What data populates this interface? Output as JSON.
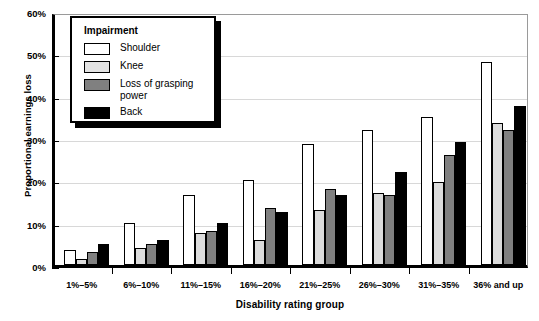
{
  "chart_data": {
    "type": "bar",
    "title": "",
    "xlabel": "Disability rating group",
    "ylabel": "Proportional earnings loss",
    "categories": [
      "1%–5%",
      "6%–10%",
      "11%–15%",
      "16%–20%",
      "21%–25%",
      "26%–30%",
      "31%–35%",
      "36% and up"
    ],
    "series": [
      {
        "name": "Shoulder",
        "color": "#ffffff",
        "values": [
          3.5,
          10.0,
          16.5,
          20.0,
          28.5,
          32.0,
          35.0,
          48.0
        ]
      },
      {
        "name": "Knee",
        "color": "#dcdcdc",
        "values": [
          1.5,
          4.0,
          7.5,
          6.0,
          13.0,
          17.0,
          19.5,
          33.5
        ]
      },
      {
        "name": "Loss of grasping power",
        "color": "#808080",
        "values": [
          3.0,
          5.0,
          8.0,
          13.5,
          18.0,
          16.5,
          26.0,
          32.0
        ]
      },
      {
        "name": "Back",
        "color": "#000000",
        "values": [
          5.0,
          6.0,
          10.0,
          12.5,
          16.5,
          22.0,
          29.0,
          37.5
        ]
      }
    ],
    "ylim": [
      0,
      60
    ],
    "yticks": [
      0,
      10,
      20,
      30,
      40,
      50,
      60
    ],
    "ytick_labels": [
      "0%",
      "10%",
      "20%",
      "30%",
      "40%",
      "50%",
      "60%"
    ],
    "grid": "horizontal",
    "legend_position": "top-left",
    "legend_title": "Impairment",
    "legend_entries": [
      "Shoulder",
      "Knee",
      "Loss of grasping\npower",
      "Back"
    ]
  }
}
